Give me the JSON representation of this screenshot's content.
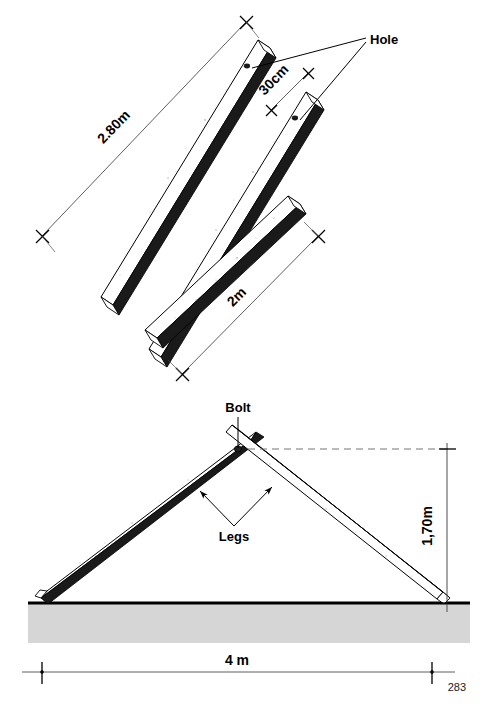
{
  "figure": {
    "page_number": "283",
    "colors": {
      "ink": "#000000",
      "beam_face": "#ffffff",
      "beam_shadow": "#111111",
      "ground_fill": "#d6d6d6",
      "dimension_line": "#4d4d4d",
      "dashed_line": "#777777"
    },
    "top_view": {
      "name": "exploded-beams-view",
      "beams": [
        {
          "id": "beam-long-1",
          "length_label": "2.80m",
          "has_hole": true
        },
        {
          "id": "beam-long-2",
          "length_label": "2.80m",
          "has_hole": true
        },
        {
          "id": "beam-short",
          "length_label": "2m",
          "has_hole": false
        }
      ],
      "dimensions": [
        {
          "name": "length-2-80m",
          "label": "2.80m"
        },
        {
          "name": "hole-offset-30cm",
          "label": "30cm"
        },
        {
          "name": "length-2m",
          "label": "2m"
        }
      ],
      "callouts": [
        {
          "name": "hole-callout",
          "label": "Hole"
        }
      ]
    },
    "assembly_view": {
      "name": "a-frame-assembly-view",
      "callouts": [
        {
          "name": "bolt-callout",
          "label": "Bolt"
        },
        {
          "name": "legs-callout",
          "label": "Legs"
        }
      ],
      "dimensions": [
        {
          "name": "height-dimension",
          "label": "1,70m"
        },
        {
          "name": "span-dimension",
          "label": "4 m"
        }
      ]
    }
  }
}
